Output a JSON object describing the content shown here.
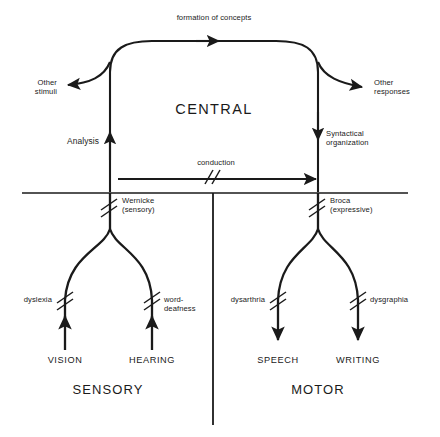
{
  "diagram": {
    "title_center": "CENTRAL",
    "colors": {
      "ink": "#1a1a1a",
      "background": "#ffffff"
    },
    "labels": {
      "formation_of_concepts": "formation of concepts",
      "other_stimuli": "Other\nstimuli",
      "other_responses": "Other\nresponses",
      "analysis": "Analysis",
      "syntactical_organization": "Syntactical\norganization",
      "conduction": "conduction",
      "wernicke": "Wernicke\n(sensory)",
      "broca": "Broca\n(expressive)",
      "dyslexia": "dyslexia",
      "word_deafness": "word-\ndeafness",
      "dysarthria": "dysarthria",
      "dysgraphia": "dysgraphia",
      "vision": "VISION",
      "hearing": "HEARING",
      "speech": "SPEECH",
      "writing": "WRITING",
      "sensory": "SENSORY",
      "motor": "MOTOR"
    }
  }
}
